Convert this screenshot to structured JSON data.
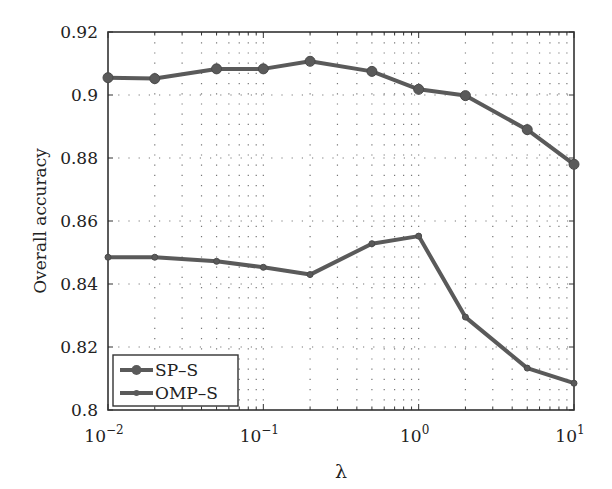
{
  "chart_data": {
    "type": "line",
    "title": "",
    "xlabel": "λ",
    "ylabel": "Overall accuracy",
    "xscale": "log",
    "xlim": [
      0.01,
      10
    ],
    "ylim": [
      0.8,
      0.92
    ],
    "grid": "dotted",
    "legend_position": "lower left",
    "x": [
      0.01,
      0.02,
      0.05,
      0.1,
      0.2,
      0.5,
      1,
      2,
      5,
      10
    ],
    "x_tick_labels": [
      "10^-2",
      "10^-1",
      "10^0",
      "10^1"
    ],
    "y_tick_labels": [
      "0.8",
      "0.82",
      "0.84",
      "0.86",
      "0.88",
      "0.9",
      "0.92"
    ],
    "series": [
      {
        "name": "SP-S",
        "marker": "circle-large",
        "values": [
          0.9055,
          0.9052,
          0.9083,
          0.9083,
          0.9107,
          0.9075,
          0.9018,
          0.8998,
          0.889,
          0.878
        ]
      },
      {
        "name": "OMP-S",
        "marker": "circle-small",
        "values": [
          0.8485,
          0.8485,
          0.8472,
          0.8453,
          0.843,
          0.8528,
          0.8552,
          0.8295,
          0.8133,
          0.8085
        ]
      }
    ],
    "colors": {
      "line": "#5a5a5a",
      "axis": "#333333",
      "grid": "#777777"
    }
  }
}
